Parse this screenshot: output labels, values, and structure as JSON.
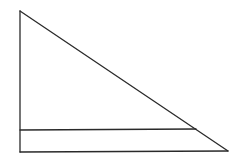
{
  "diagram": {
    "type": "right-triangle-with-parallel-line",
    "stroke_color": "#2a2a2a",
    "background": "#ffffff",
    "triangle": {
      "apex": [
        20,
        11
      ],
      "bottom_left": [
        20,
        152
      ],
      "bottom_right": [
        228,
        151
      ]
    },
    "parallel_segment": {
      "start": [
        20,
        130
      ],
      "end": [
        196,
        129
      ]
    }
  }
}
